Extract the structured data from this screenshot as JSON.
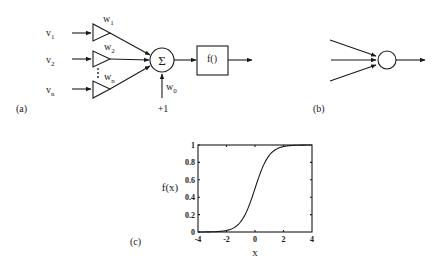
{
  "panel_a": {
    "label": "(a)",
    "inputs": [
      {
        "name": "v",
        "sub": "1",
        "weight": "w",
        "weight_sub": "1"
      },
      {
        "name": "v",
        "sub": "2",
        "weight": "w",
        "weight_sub": "2"
      },
      {
        "name": "v",
        "sub": "n",
        "weight": "w",
        "weight_sub": "n"
      }
    ],
    "ellipsis": "⋮",
    "sum_symbol": "Σ",
    "activation_label": "f()",
    "bias_weight": "w",
    "bias_weight_sub": "0",
    "bias_input": "+1"
  },
  "panel_b": {
    "label": "(b)"
  },
  "panel_c": {
    "label": "(c)"
  },
  "chart_data": {
    "type": "line",
    "title": "",
    "xlabel": "x",
    "ylabel": "f(x)",
    "xlim": [
      -4,
      4
    ],
    "ylim": [
      0,
      1
    ],
    "x_ticks": [
      "-4",
      "-2",
      "0",
      "2",
      "4"
    ],
    "y_ticks": [
      "0",
      "0.2",
      "0.4",
      "0.6",
      "0.8",
      "1"
    ],
    "grid": false,
    "series": [
      {
        "name": "sigmoid",
        "x": [
          -4,
          -3,
          -2,
          -1.5,
          -1,
          -0.5,
          0,
          0.5,
          1,
          1.5,
          2,
          3,
          4
        ],
        "values": [
          0.0003,
          0.002,
          0.018,
          0.047,
          0.12,
          0.27,
          0.5,
          0.73,
          0.88,
          0.953,
          0.982,
          0.998,
          0.9997
        ]
      }
    ]
  }
}
